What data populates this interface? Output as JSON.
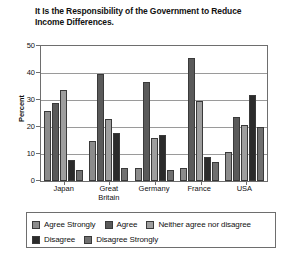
{
  "chart_data": {
    "type": "bar",
    "title": "It Is the Responsibility of the Government to Reduce Income Differences.",
    "xlabel": "",
    "ylabel": "Percent",
    "ylim": [
      0,
      50
    ],
    "yticks": [
      0,
      10,
      20,
      30,
      40,
      50
    ],
    "grid": true,
    "legend_position": "bottom",
    "categories": [
      "Japan",
      "Great Britain",
      "Germany",
      "France",
      "USA"
    ],
    "series": [
      {
        "name": "Agree Strongly",
        "color": "#8c8c8c",
        "values": [
          26,
          15,
          5,
          5,
          11
        ]
      },
      {
        "name": "Agree",
        "color": "#5a5a5a",
        "values": [
          29,
          40,
          37,
          46,
          24
        ]
      },
      {
        "name": "Neither agree nor disagree",
        "color": "#9e9e9e",
        "values": [
          34,
          23,
          16,
          30,
          21
        ]
      },
      {
        "name": "Disagree",
        "color": "#2b2b2b",
        "values": [
          8,
          18,
          17,
          9,
          32
        ]
      },
      {
        "name": "Disagree Strongly",
        "color": "#707070",
        "values": [
          4,
          5,
          4,
          7,
          20
        ]
      }
    ]
  },
  "axis": {
    "y_title": "Percent",
    "y_tick_labels": [
      "50",
      "40",
      "30",
      "20",
      "10",
      "0"
    ],
    "x_tick_labels": [
      "Japan",
      "Great\nBritain",
      "Germany",
      "France",
      "USA"
    ]
  },
  "legend": {
    "row1": [
      "Agree Strongly",
      "Agree",
      "Neither agree nor disagree"
    ],
    "row2": [
      "Disagree",
      "Disagree Strongly"
    ]
  }
}
